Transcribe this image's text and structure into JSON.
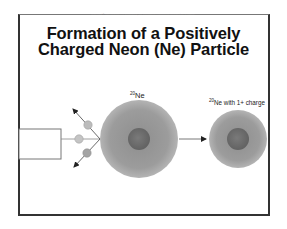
{
  "slide": {
    "copyright": "Copyright © The McGraw-Hill Companies, Inc. Permission required for reproduction or display.",
    "title_line1": "Formation of a Positively",
    "title_line2": "Charged Neon (Ne) Particle"
  },
  "diagram": {
    "source_box": {
      "label": ""
    },
    "electrons": [
      {
        "name": "electron-upper",
        "direction": "up-left"
      },
      {
        "name": "electron-middle",
        "direction": "left"
      },
      {
        "name": "electron-lower",
        "direction": "down-left"
      }
    ],
    "neutral_atom": {
      "mass_number": "20",
      "symbol": "Ne",
      "label_suffix": ""
    },
    "ion": {
      "mass_number": "20",
      "symbol": "Ne",
      "label_suffix": " with 1+ charge"
    },
    "colors": {
      "electron_cloud": "#9c9c9c",
      "nucleus": "#6e6e6e",
      "electron": "#b8b8b8",
      "line": "#555555"
    }
  }
}
